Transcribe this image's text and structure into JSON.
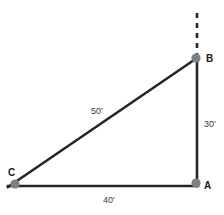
{
  "figure": {
    "kind": "right-triangle-diagram",
    "background_color": "#ffffff",
    "line_color": "#262626",
    "vertex_marker_color": "#7f7f7f",
    "label_color": "#1c1c1c",
    "measure_color": "#3a3a3a"
  },
  "vertices": {
    "a": {
      "label": "A",
      "x": 197,
      "y": 186
    },
    "b": {
      "label": "B",
      "x": 197,
      "y": 58
    },
    "c": {
      "label": "C",
      "x": 10,
      "y": 186
    }
  },
  "sides": {
    "ab": {
      "label": "30'",
      "value": 30,
      "unit": "feet",
      "orientation": "vertical"
    },
    "ca": {
      "label": "40'",
      "value": 40,
      "unit": "feet",
      "orientation": "horizontal"
    },
    "cb": {
      "label": "50'",
      "value": 50,
      "unit": "feet",
      "orientation": "hypotenuse"
    }
  },
  "dashed_extension": {
    "from_vertex": "B",
    "x": 197,
    "y_top": 13,
    "y_bottom": 56,
    "dash_pattern": "5 5"
  }
}
